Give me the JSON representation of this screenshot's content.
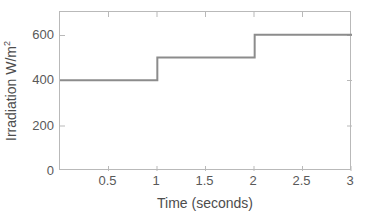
{
  "chart_data": {
    "type": "line",
    "subtype": "step-post",
    "title": "",
    "xlabel": "Time (seconds)",
    "ylabel": "Irradiation W/m",
    "ylabel_superscript": "2",
    "ylabel_full": "Irradiation W/m²",
    "xlim": [
      0,
      3
    ],
    "ylim": [
      0,
      700
    ],
    "xticks": [
      0.5,
      1,
      1.5,
      2,
      2.5,
      3
    ],
    "xtick_labels": [
      "0.5",
      "1",
      "1.5",
      "2",
      "2.5",
      "3"
    ],
    "yticks": [
      0,
      200,
      400,
      600
    ],
    "ytick_labels": [
      "0",
      "200",
      "400",
      "600"
    ],
    "grid": false,
    "legend": null,
    "series": [
      {
        "name": "Irradiation",
        "color": "#8c8c8c",
        "line_width": 2,
        "x": [
          0,
          1,
          1,
          2,
          2,
          3
        ],
        "y": [
          400,
          400,
          500,
          500,
          600,
          600
        ],
        "steps": [
          {
            "x_start": 0,
            "x_end": 1,
            "value": 400
          },
          {
            "x_start": 1,
            "x_end": 2,
            "value": 500
          },
          {
            "x_start": 2,
            "x_end": 3,
            "value": 600
          }
        ]
      }
    ],
    "axes_color": "#b9b9b9",
    "tick_label_color": "#595959",
    "axis_label_color": "#4d4d4d",
    "background": "#ffffff"
  }
}
